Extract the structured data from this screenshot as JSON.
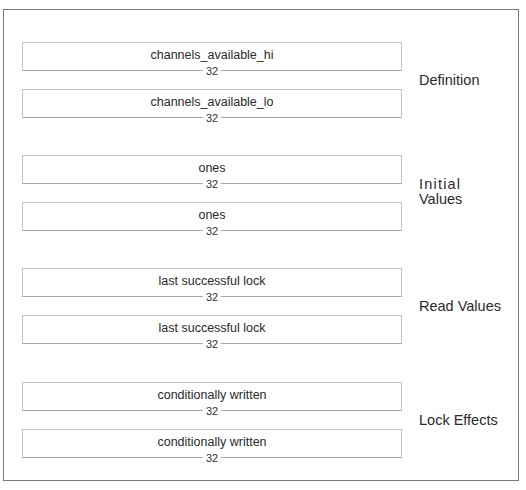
{
  "groups": [
    {
      "label_lines": [
        "Definition"
      ],
      "fields": [
        {
          "name": "channels_available_hi",
          "width": "32"
        },
        {
          "name": "channels_available_lo",
          "width": "32"
        }
      ]
    },
    {
      "label_lines": [
        "Initial",
        "Values"
      ],
      "fields": [
        {
          "name": "ones",
          "width": "32"
        },
        {
          "name": "ones",
          "width": "32"
        }
      ]
    },
    {
      "label_lines": [
        "Read Values"
      ],
      "fields": [
        {
          "name": "last successful lock",
          "width": "32"
        },
        {
          "name": "last successful lock",
          "width": "32"
        }
      ]
    },
    {
      "label_lines": [
        "Lock Effects"
      ],
      "fields": [
        {
          "name": "conditionally written",
          "width": "32"
        },
        {
          "name": "conditionally written",
          "width": "32"
        }
      ]
    }
  ]
}
